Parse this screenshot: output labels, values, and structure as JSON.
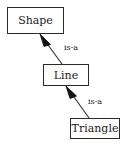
{
  "diagram": {
    "type": "uml-class-inheritance",
    "width": 124,
    "height": 146,
    "background_color": "#ffffff",
    "stroke_color": "#2b2b2b",
    "text_color": "#1a1a1a",
    "nodes": [
      {
        "id": "shape",
        "label": "Shape",
        "x": 7,
        "y": 7,
        "width": 57,
        "height": 27
      },
      {
        "id": "line",
        "label": "Line",
        "x": 43,
        "y": 64,
        "width": 46,
        "height": 22
      },
      {
        "id": "triangle",
        "label": "Triangle",
        "x": 70,
        "y": 118,
        "width": 50,
        "height": 21
      }
    ],
    "edges": [
      {
        "id": "line-is-a-shape",
        "from": "line",
        "to": "shape",
        "label": "is-a",
        "arrowhead": "filled-triangle",
        "label_x": 64,
        "label_y": 44
      },
      {
        "id": "triangle-is-a-line",
        "from": "triangle",
        "to": "line",
        "label": "is-a",
        "arrowhead": "filled-triangle",
        "label_x": 88,
        "label_y": 98
      }
    ]
  }
}
